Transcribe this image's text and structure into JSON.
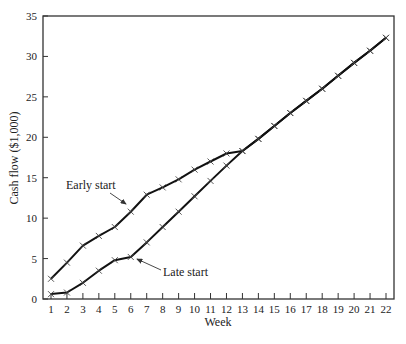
{
  "chart_data": {
    "type": "line",
    "title": "",
    "xlabel": "Week",
    "ylabel": "Cash flow ($1,000)",
    "xlim": [
      1,
      22
    ],
    "ylim": [
      0,
      35
    ],
    "yticks": [
      0,
      5,
      10,
      15,
      20,
      25,
      30,
      35
    ],
    "x": [
      1,
      2,
      3,
      4,
      5,
      6,
      7,
      8,
      9,
      10,
      11,
      12,
      13,
      14,
      15,
      16,
      17,
      18,
      19,
      20,
      21,
      22
    ],
    "grid": false,
    "legend": "none (inline annotations)",
    "series": [
      {
        "name": "Early start",
        "x": [
          1,
          2,
          3,
          4,
          5,
          6,
          7,
          8,
          9,
          10,
          11,
          12,
          13,
          14,
          15,
          16,
          17,
          18,
          19,
          20,
          21,
          22
        ],
        "values": [
          2.5,
          4.5,
          6.6,
          7.8,
          8.9,
          10.8,
          12.9,
          13.8,
          14.8,
          16.0,
          17.0,
          18.0,
          18.3,
          19.8,
          21.4,
          23.0,
          24.5,
          26.0,
          27.6,
          29.2,
          30.7,
          32.3
        ]
      },
      {
        "name": "Late start",
        "x": [
          1,
          2,
          3,
          4,
          5,
          6,
          7,
          8,
          9,
          10,
          11,
          12,
          13,
          14,
          15,
          16,
          17,
          18,
          19,
          20,
          21,
          22
        ],
        "values": [
          0.6,
          0.8,
          2.0,
          3.5,
          4.8,
          5.2,
          7.0,
          8.9,
          10.8,
          12.7,
          14.6,
          16.5,
          18.3,
          19.8,
          21.4,
          23.0,
          24.5,
          26.0,
          27.6,
          29.2,
          30.7,
          32.3
        ]
      }
    ],
    "annotations": [
      {
        "text": "Early start",
        "points_to_week": 6,
        "series": "Early start"
      },
      {
        "text": "Late start",
        "points_to_week": 6,
        "series": "Late start"
      }
    ]
  }
}
